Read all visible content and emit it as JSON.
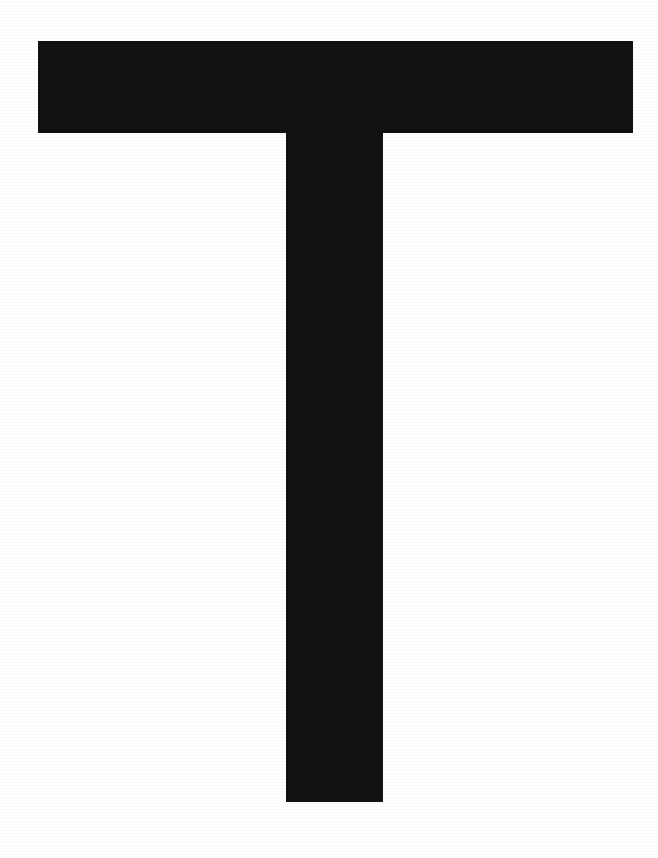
{
  "image": {
    "kind": "glyph-specimen",
    "character": "T",
    "description": "Capital letter T rendered as a solid black sans-serif glyph centered on a plain white page",
    "script": "Latin",
    "case": "uppercase",
    "width": 658,
    "height": 858,
    "background_color": "#FFFFFF",
    "glyph_color": "#111111",
    "alt_text": "T"
  },
  "geometry": {
    "crossbar": {
      "name": "crossbar",
      "x": 38,
      "y": 41,
      "width": 595,
      "height": 92
    },
    "stem": {
      "name": "stem",
      "x": 286,
      "y": 133,
      "width": 97,
      "height": 669
    },
    "bounding_box": {
      "x": 38,
      "y": 41,
      "width": 595,
      "height": 761
    },
    "margins": {
      "left": 38,
      "right": 25,
      "top": 41,
      "bottom": 56
    }
  }
}
